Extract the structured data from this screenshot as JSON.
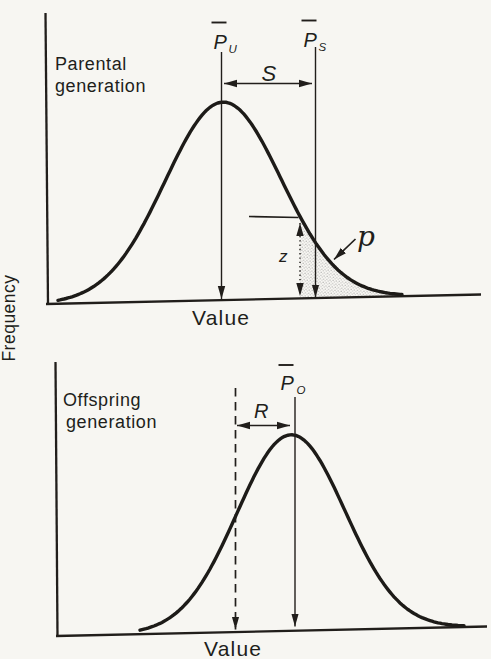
{
  "figure": {
    "background_color": "#f7f6f2",
    "ink_color": "#211e1b",
    "stipple_dot_color": "#8a8a8a",
    "ylabel": "Frequency"
  },
  "chart_data": [
    {
      "panel": "parental",
      "type": "area",
      "title_lines": [
        "Parental",
        "generation"
      ],
      "xlabel": "Value",
      "ylabel": "Frequency",
      "axis_numeric_labels": "none shown",
      "baseline": {
        "x0": 46,
        "y0": 304,
        "x1": 481,
        "y1": 294.5
      },
      "curve": {
        "shape": "gaussian",
        "mean_x": 223,
        "sd_px": 58,
        "peak_px": 198,
        "x_start": 58,
        "x_end": 402
      },
      "annotations": {
        "mean_unselected": {
          "base": "P",
          "overbar": true,
          "sub": "U",
          "x": 221.5
        },
        "mean_selected": {
          "base": "P",
          "overbar": true,
          "sub": "S",
          "x": 315.5
        },
        "selection_differential": {
          "label": "S",
          "from_x": 224,
          "to_x": 312,
          "y": 83.5
        },
        "truncation_ordinate": {
          "label": "z",
          "x": 300
        },
        "selected_proportion": {
          "label": "p",
          "region_from_x": 300,
          "region_to_x": 400,
          "fill": "stipple"
        }
      }
    },
    {
      "panel": "offspring",
      "type": "line",
      "title_lines": [
        "Offspring",
        "generation"
      ],
      "xlabel": "Value",
      "axis_numeric_labels": "none shown",
      "baseline": {
        "x0": 56,
        "y0": 636,
        "x1": 487,
        "y1": 626.5
      },
      "curve": {
        "shape": "gaussian",
        "mean_x": 291,
        "sd_px": 54,
        "peak_px": 196,
        "x_start": 140,
        "x_end": 464
      },
      "annotations": {
        "mean_offspring": {
          "base": "P",
          "overbar": true,
          "sub": "O",
          "x": 295
        },
        "parental_mean_reference": {
          "style": "dashed",
          "x": 235.5
        },
        "response_to_selection": {
          "label": "R",
          "from_x": 237,
          "to_x": 290,
          "y": 425.5
        }
      }
    }
  ]
}
